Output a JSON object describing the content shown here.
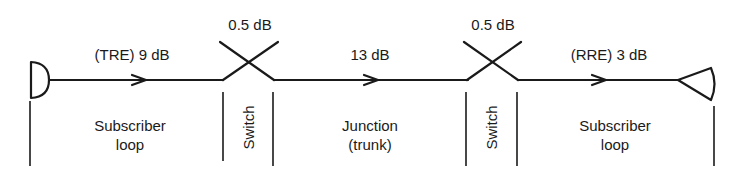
{
  "diagram": {
    "stroke_color": "#1a1a1a",
    "background": "#ffffff",
    "loss_labels": {
      "tre": "(TRE) 9 dB",
      "switch1": "0.5 dB",
      "junction": "13 dB",
      "switch2": "0.5 dB",
      "rre": "(RRE) 3 dB"
    },
    "sections": {
      "subscriber_loop_1": {
        "line1": "Subscriber",
        "line2": "loop"
      },
      "switch_1": "Switch",
      "junction": {
        "line1": "Junction",
        "line2": "(trunk)"
      },
      "switch_2": "Switch",
      "subscriber_loop_2": {
        "line1": "Subscriber",
        "line2": "loop"
      }
    },
    "elements": [
      {
        "type": "transmitter",
        "shape": "half-circle"
      },
      {
        "type": "switch",
        "shape": "cross"
      },
      {
        "type": "switch",
        "shape": "cross"
      },
      {
        "type": "receiver",
        "shape": "triangle"
      }
    ]
  }
}
